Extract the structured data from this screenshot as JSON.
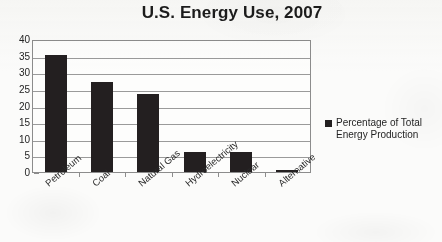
{
  "chart_data": {
    "type": "bar",
    "title": "U.S. Energy Use, 2007",
    "xlabel": "",
    "ylabel": "",
    "ylim": [
      0,
      40
    ],
    "yticks": [
      40,
      35,
      30,
      25,
      20,
      15,
      10,
      5,
      0
    ],
    "grid": true,
    "legend_position": "right",
    "categories": [
      "Petroleum",
      "Coal",
      "Natural Gas",
      "Hydroelectricity",
      "Nuclear",
      "Alternative"
    ],
    "series": [
      {
        "name": "Percentage of Total Energy Production",
        "color": "#231f20",
        "values": [
          35.3,
          27.2,
          23.5,
          6.1,
          6.0,
          0.7
        ]
      }
    ]
  },
  "legend": {
    "marker": "legend-square-marker",
    "label": "Percentage of Total Energy Production"
  }
}
